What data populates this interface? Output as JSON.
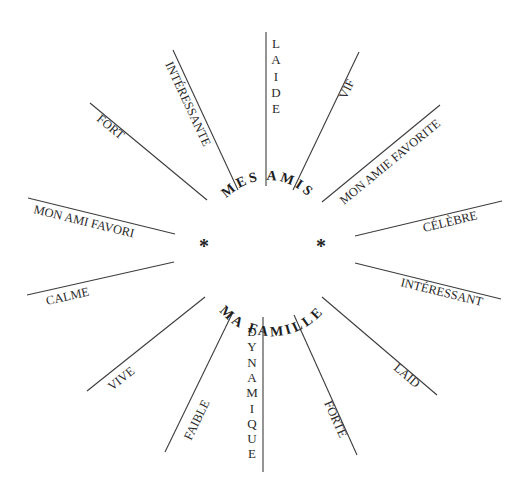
{
  "center": {
    "top_label": "MES AMIS",
    "bottom_label": "MA FAMILLE",
    "left_marker": "*",
    "right_marker": "*"
  },
  "spokes": [
    {
      "label": "LAIDE",
      "orientation": "vertical"
    },
    {
      "label": "VIF",
      "orientation": "angled"
    },
    {
      "label": "MON AMIE FAVORITE",
      "orientation": "angled"
    },
    {
      "label": "CÉLÈBRE",
      "orientation": "angled"
    },
    {
      "label": "INTÉRESSANT",
      "orientation": "angled"
    },
    {
      "label": "LAID",
      "orientation": "angled"
    },
    {
      "label": "FORTE",
      "orientation": "angled"
    },
    {
      "label": "DYNAMIQUE",
      "orientation": "vertical"
    },
    {
      "label": "FAIBLE",
      "orientation": "angled"
    },
    {
      "label": "VIVE",
      "orientation": "angled"
    },
    {
      "label": "CALME",
      "orientation": "angled"
    },
    {
      "label": "MON AMI FAVORI",
      "orientation": "angled"
    },
    {
      "label": "FORT",
      "orientation": "angled"
    },
    {
      "label": "INTÉRESSANTE",
      "orientation": "angled"
    }
  ],
  "colors": {
    "line": "#3c3c3c",
    "text": "#2a2a2a",
    "background": "#ffffff"
  }
}
